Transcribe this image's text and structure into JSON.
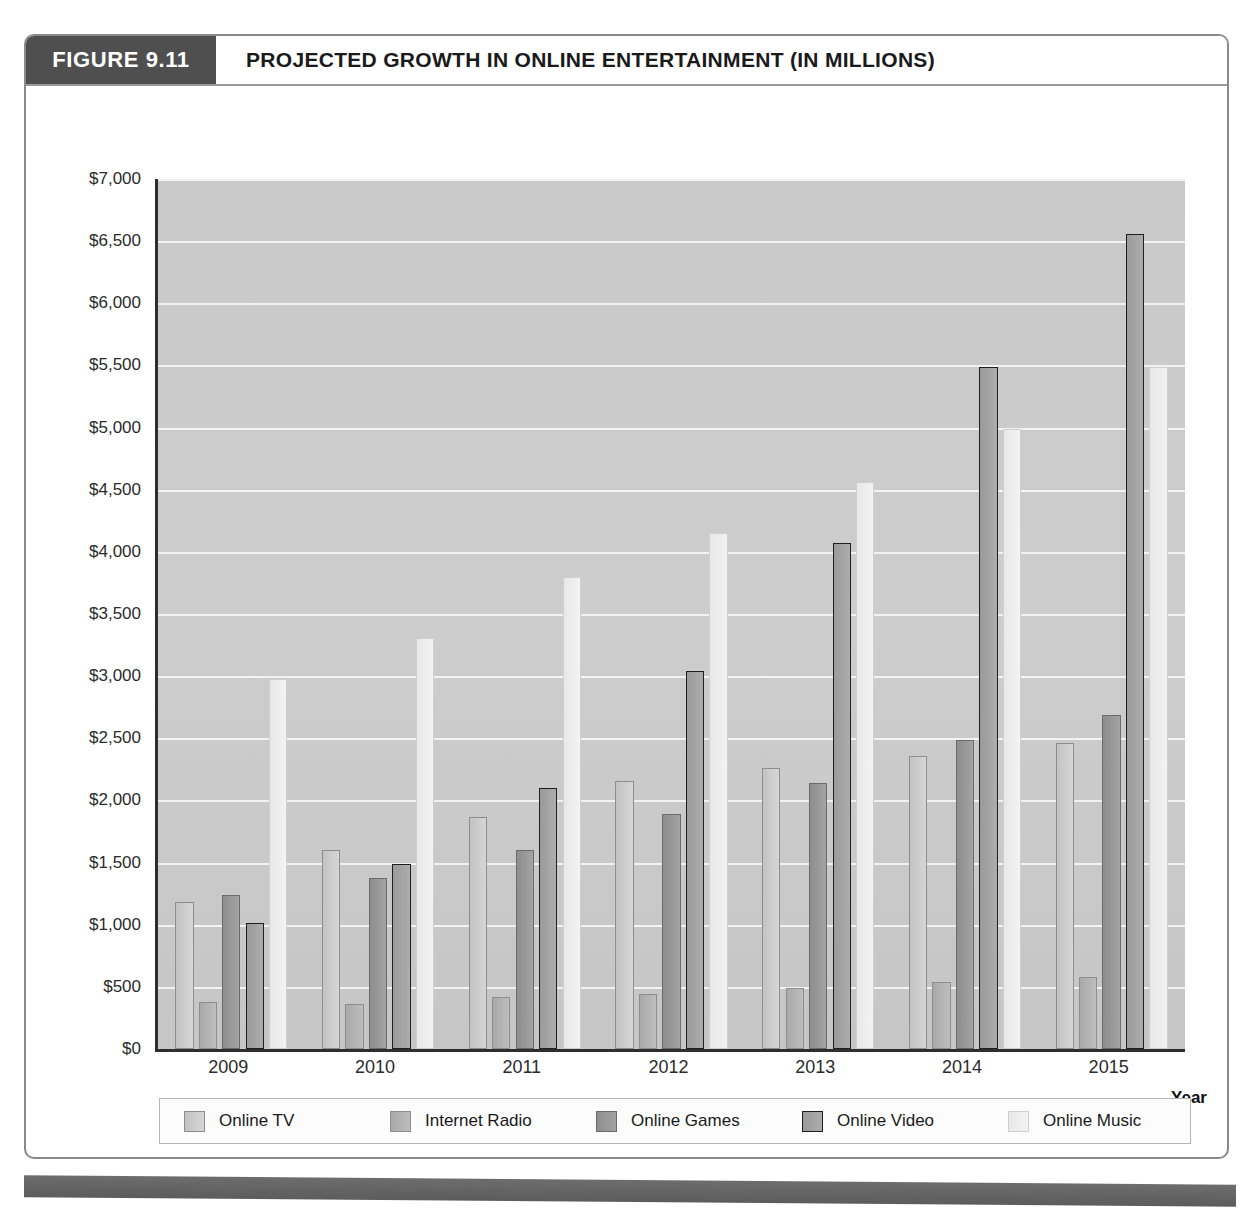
{
  "figure": {
    "number_label": "FIGURE 9.11",
    "title": "PROJECTED GROWTH IN ONLINE ENTERTAINMENT (IN MILLIONS)"
  },
  "colors": {
    "figure_number_bg": "#4f4f4f",
    "plot_bg": "#c9c9c9",
    "gridline": "#f2f2f2",
    "axis": "#2e2e2e",
    "footer_bar": "#6d6d6d",
    "series": [
      "#c9c9c9",
      "#b0b0b0",
      "#949494",
      "#a0a0a0",
      "#eeeeee"
    ]
  },
  "legend": {
    "position": "bottom",
    "items": [
      {
        "label": "Online TV",
        "swatch_class": "s0",
        "swatch_name": "legend-swatch-online-tv"
      },
      {
        "label": "Internet Radio",
        "swatch_class": "s1",
        "swatch_name": "legend-swatch-internet-radio"
      },
      {
        "label": "Online Games",
        "swatch_class": "s2",
        "swatch_name": "legend-swatch-online-games"
      },
      {
        "label": "Online Video",
        "swatch_class": "s3",
        "swatch_name": "legend-swatch-online-video"
      },
      {
        "label": "Online Music",
        "swatch_class": "s4",
        "swatch_name": "legend-swatch-online-music"
      }
    ]
  },
  "chart_data": {
    "type": "bar",
    "title": "PROJECTED GROWTH IN ONLINE ENTERTAINMENT (IN MILLIONS)",
    "xlabel": "Year",
    "ylabel": "",
    "ylim": [
      0,
      7000
    ],
    "ytick_step": 500,
    "ytick_labels": [
      "$7,000",
      "$6,500",
      "$6,000",
      "$5,500",
      "$5,000",
      "$4,500",
      "$4,000",
      "$3,500",
      "$3,000",
      "$2,500",
      "$2,000",
      "$1,500",
      "$1,000",
      "$500",
      "$0"
    ],
    "ytick_values": [
      7000,
      6500,
      6000,
      5500,
      5000,
      4500,
      4000,
      3500,
      3000,
      2500,
      2000,
      1500,
      1000,
      500,
      0
    ],
    "grid": true,
    "grid_axis": "y",
    "categories": [
      "2009",
      "2010",
      "2011",
      "2012",
      "2013",
      "2014",
      "2015"
    ],
    "series": [
      {
        "name": "Online TV",
        "values": [
          1180,
          1600,
          1870,
          2160,
          2260,
          2360,
          2460
        ]
      },
      {
        "name": "Internet Radio",
        "values": [
          380,
          360,
          420,
          440,
          490,
          540,
          580
        ]
      },
      {
        "name": "Online Games",
        "values": [
          1240,
          1380,
          1600,
          1890,
          2140,
          2490,
          2690
        ]
      },
      {
        "name": "Online Video",
        "values": [
          1010,
          1490,
          2100,
          3040,
          4070,
          5490,
          6560
        ]
      },
      {
        "name": "Online Music",
        "values": [
          2980,
          3310,
          3800,
          4150,
          4560,
          4990,
          5490
        ]
      }
    ],
    "units": "millions of dollars"
  }
}
